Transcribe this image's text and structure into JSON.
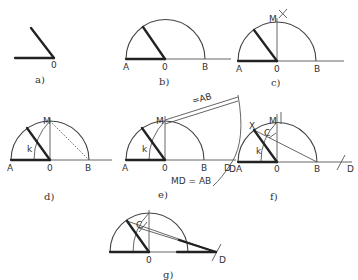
{
  "panels": {
    "a": {
      "caption": "a)",
      "labels": {
        "O": "0"
      }
    },
    "b": {
      "caption": "b)",
      "labels": {
        "A": "A",
        "O": "0",
        "B": "B"
      }
    },
    "c": {
      "caption": "c)",
      "labels": {
        "A": "A",
        "O": "0",
        "B": "B",
        "M": "M"
      }
    },
    "d": {
      "caption": "d)",
      "labels": {
        "A": "A",
        "O": "0",
        "B": "B",
        "M": "M",
        "k": "k"
      }
    },
    "e": {
      "caption": "e)",
      "labels": {
        "A": "A",
        "O": "0",
        "B": "B",
        "M": "M",
        "k": "k",
        "D": "D",
        "strip": "=AB",
        "equation": "MD = AB"
      }
    },
    "f": {
      "caption": "f)",
      "labels": {
        "A": "A",
        "O": "0",
        "B": "B",
        "M": "M",
        "k": "k",
        "D": "D",
        "D2": "D",
        "X": "X",
        "C": "C"
      }
    },
    "g": {
      "caption": "g)",
      "labels": {
        "O": "0",
        "C": "C",
        "D": "D"
      }
    }
  },
  "colors": {
    "ink": "#333333",
    "background": "#ffffff"
  }
}
